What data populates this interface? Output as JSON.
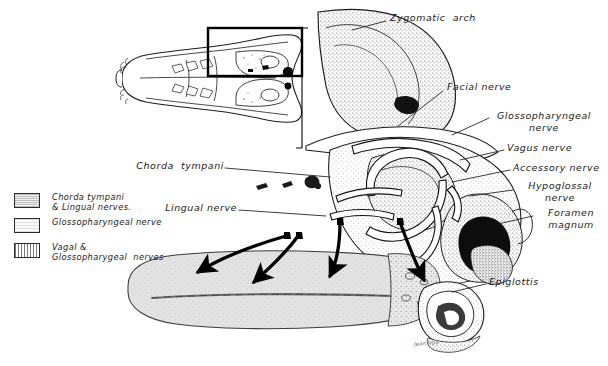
{
  "figure": {
    "medium": "pen-and-ink stipple drawing",
    "background_color": "#ffffff",
    "ink_color": "#1a1a1a"
  },
  "inset": {
    "name": "ventral-skull-inset",
    "description": "ventral view of rodent skull with detail region marked",
    "detail_rect_color": "#000000"
  },
  "labels": [
    {
      "id": "zygomatic-arch",
      "text": "Zygomatic  arch",
      "x": 390,
      "y": 17,
      "align": "left"
    },
    {
      "id": "facial-nerve",
      "text": "Facial nerve",
      "x": 447,
      "y": 86,
      "align": "left"
    },
    {
      "id": "glossopharyngeal-nerve",
      "text": "Glossopharyngeal\nnerve",
      "x": 492,
      "y": 115,
      "align": "left"
    },
    {
      "id": "vagus-nerve",
      "text": "Vagus nerve",
      "x": 507,
      "y": 147,
      "align": "left"
    },
    {
      "id": "accessory-nerve",
      "text": "Accessory nerve",
      "x": 513,
      "y": 167,
      "align": "left"
    },
    {
      "id": "hypoglossal-nerve",
      "text": "Hypoglossal\nnerve",
      "x": 516,
      "y": 185,
      "align": "left"
    },
    {
      "id": "foramen-magnum",
      "text": "Foramen\nmagnum",
      "x": 536,
      "y": 212,
      "align": "left"
    },
    {
      "id": "epiglottis",
      "text": "Epiglottis",
      "x": 489,
      "y": 281,
      "align": "left"
    },
    {
      "id": "chorda-tympani",
      "text": "Chorda  tympani",
      "x": 140,
      "y": 165,
      "align": "left"
    },
    {
      "id": "lingual-nerve",
      "text": "Lingual nerve",
      "x": 168,
      "y": 207,
      "align": "left"
    }
  ],
  "legend": {
    "name": "nerve-territory-legend",
    "entries": [
      {
        "id": "chorda-tympani-lingual",
        "swatch": "medium-stipple",
        "text": "Chorda tympani\n& Lingual nerves."
      },
      {
        "id": "glossopharyngeal",
        "swatch": "light-stipple",
        "text": "Glossopharyngeal nerve"
      },
      {
        "id": "vagal-glossopharyngeal",
        "swatch": "vertical-hatch",
        "text": "Vagal &\nGlossopharygeal  nerves"
      }
    ]
  },
  "arrows": {
    "name": "innervation-arrows",
    "count": 4,
    "description": "four solid black arrows curving from the nerve trunks down onto the dorsum of the tongue",
    "color": "#000000"
  },
  "signature": {
    "text": "Jean Hou"
  }
}
